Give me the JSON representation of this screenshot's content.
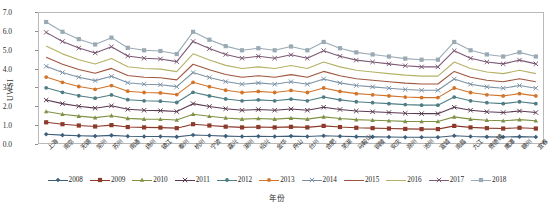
{
  "chart_data": {
    "type": "line",
    "title": "",
    "xlabel": "年份",
    "ylabel": "UWSI",
    "ylim": [
      0.0,
      7.0
    ],
    "ytick_values": [
      0.0,
      1.0,
      2.0,
      3.0,
      4.0,
      5.0,
      6.0,
      7.0
    ],
    "ytick_labels": [
      "0.0",
      "1.0",
      "2.0",
      "3.0",
      "4.0",
      "5.0",
      "6.0",
      "7.0"
    ],
    "grid": false,
    "legend_position": "bottom",
    "categories": [
      "上海",
      "南京",
      "无锡",
      "常州",
      "苏州",
      "南通",
      "扬州",
      "镇江",
      "泰州",
      "杭州",
      "宁波",
      "嘉兴",
      "湖州",
      "绍兴",
      "金华",
      "舟山",
      "台州",
      "合肥",
      "芜湖",
      "马鞍山",
      "铜陵",
      "安庆",
      "滁州",
      "池州",
      "宣城",
      "南昌",
      "九江",
      "景德镇",
      "鹰潭",
      "赣州",
      "宜春"
    ],
    "series": [
      {
        "name": "2008",
        "color": "#3f5f79",
        "marker": "diamond",
        "values": [
          0.52,
          0.47,
          0.44,
          0.42,
          0.46,
          0.41,
          0.4,
          0.4,
          0.38,
          0.48,
          0.45,
          0.42,
          0.4,
          0.41,
          0.4,
          0.42,
          0.4,
          0.44,
          0.41,
          0.39,
          0.38,
          0.37,
          0.36,
          0.36,
          0.36,
          0.44,
          0.4,
          0.38,
          0.37,
          0.39,
          0.37
        ]
      },
      {
        "name": "2009",
        "color": "#8c3a2b",
        "marker": "square",
        "values": [
          1.15,
          1.05,
          0.98,
          0.93,
          1.0,
          0.9,
          0.88,
          0.87,
          0.84,
          1.05,
          0.98,
          0.92,
          0.88,
          0.9,
          0.88,
          0.91,
          0.88,
          0.96,
          0.9,
          0.86,
          0.84,
          0.82,
          0.8,
          0.79,
          0.79,
          0.96,
          0.88,
          0.84,
          0.82,
          0.86,
          0.82
        ]
      },
      {
        "name": "2010",
        "color": "#7f9144",
        "marker": "triangle",
        "values": [
          1.72,
          1.58,
          1.48,
          1.4,
          1.5,
          1.36,
          1.32,
          1.31,
          1.27,
          1.58,
          1.47,
          1.38,
          1.32,
          1.35,
          1.32,
          1.37,
          1.32,
          1.44,
          1.35,
          1.29,
          1.26,
          1.23,
          1.2,
          1.19,
          1.19,
          1.44,
          1.32,
          1.26,
          1.23,
          1.29,
          1.23
        ]
      },
      {
        "name": "2011",
        "color": "#5b3a52",
        "marker": "cross",
        "values": [
          2.33,
          2.14,
          2.0,
          1.9,
          2.03,
          1.84,
          1.79,
          1.77,
          1.72,
          2.14,
          1.99,
          1.87,
          1.79,
          1.83,
          1.79,
          1.86,
          1.79,
          1.95,
          1.83,
          1.75,
          1.71,
          1.67,
          1.63,
          1.61,
          1.61,
          1.95,
          1.79,
          1.71,
          1.67,
          1.75,
          1.67
        ]
      },
      {
        "name": "2012",
        "color": "#4f7d84",
        "marker": "circle",
        "values": [
          2.98,
          2.74,
          2.56,
          2.43,
          2.6,
          2.35,
          2.29,
          2.27,
          2.2,
          2.74,
          2.55,
          2.39,
          2.29,
          2.34,
          2.29,
          2.38,
          2.29,
          2.49,
          2.34,
          2.24,
          2.19,
          2.14,
          2.09,
          2.06,
          2.06,
          2.49,
          2.29,
          2.19,
          2.14,
          2.24,
          2.14
        ]
      },
      {
        "name": "2013",
        "color": "#d2742a",
        "marker": "circle",
        "values": [
          3.55,
          3.27,
          3.05,
          2.9,
          3.1,
          2.8,
          2.73,
          2.71,
          2.62,
          3.27,
          3.04,
          2.85,
          2.73,
          2.79,
          2.73,
          2.84,
          2.73,
          2.97,
          2.79,
          2.67,
          2.61,
          2.55,
          2.49,
          2.46,
          2.46,
          2.97,
          2.73,
          2.61,
          2.55,
          2.67,
          2.55
        ]
      },
      {
        "name": "2014",
        "color": "#7d93a5",
        "marker": "cross",
        "values": [
          4.12,
          3.79,
          3.54,
          3.36,
          3.59,
          3.25,
          3.17,
          3.14,
          3.04,
          3.79,
          3.53,
          3.31,
          3.17,
          3.24,
          3.17,
          3.3,
          3.17,
          3.45,
          3.24,
          3.1,
          3.03,
          2.96,
          2.89,
          2.85,
          2.85,
          3.45,
          3.17,
          3.03,
          2.96,
          3.1,
          2.96
        ]
      },
      {
        "name": "2015",
        "color": "#a0553f",
        "marker": "none",
        "values": [
          4.6,
          4.23,
          3.95,
          3.75,
          4.01,
          3.63,
          3.54,
          3.51,
          3.4,
          4.23,
          3.94,
          3.69,
          3.54,
          3.62,
          3.54,
          3.68,
          3.54,
          3.85,
          3.62,
          3.46,
          3.38,
          3.3,
          3.23,
          3.18,
          3.18,
          3.85,
          3.54,
          3.38,
          3.3,
          3.46,
          3.3
        ]
      },
      {
        "name": "2016",
        "color": "#b5b268",
        "marker": "none",
        "values": [
          5.2,
          4.78,
          4.47,
          4.24,
          4.53,
          4.1,
          4.0,
          3.97,
          3.84,
          4.78,
          4.45,
          4.17,
          4.0,
          4.09,
          4.0,
          4.16,
          4.0,
          4.35,
          4.09,
          3.91,
          3.82,
          3.73,
          3.65,
          3.6,
          3.6,
          4.35,
          4.0,
          3.82,
          3.73,
          3.91,
          3.73
        ]
      },
      {
        "name": "2017",
        "color": "#7d5a76",
        "marker": "cross",
        "values": [
          5.92,
          5.44,
          5.09,
          4.83,
          5.16,
          4.67,
          4.55,
          4.51,
          4.37,
          5.44,
          5.06,
          4.75,
          4.55,
          4.65,
          4.55,
          4.73,
          4.55,
          4.95,
          4.65,
          4.45,
          4.35,
          4.25,
          4.15,
          4.09,
          4.09,
          4.95,
          4.55,
          4.35,
          4.25,
          4.45,
          4.25
        ]
      },
      {
        "name": "2018",
        "color": "#9aaab4",
        "marker": "square",
        "values": [
          6.47,
          5.95,
          5.56,
          5.28,
          5.64,
          5.1,
          4.97,
          4.93,
          4.77,
          5.95,
          5.53,
          5.19,
          4.97,
          5.08,
          4.97,
          5.17,
          4.97,
          5.41,
          5.08,
          4.86,
          4.75,
          4.64,
          4.53,
          4.47,
          4.47,
          5.41,
          4.97,
          4.75,
          4.64,
          4.86,
          4.64
        ]
      }
    ]
  },
  "legend": {
    "items": [
      {
        "label": "2008"
      },
      {
        "label": "2009"
      },
      {
        "label": "2010"
      },
      {
        "label": "2011"
      },
      {
        "label": "2012"
      },
      {
        "label": "2013"
      },
      {
        "label": "2014"
      },
      {
        "label": "2015"
      },
      {
        "label": "2016"
      },
      {
        "label": "2017"
      },
      {
        "label": "2018"
      }
    ]
  }
}
